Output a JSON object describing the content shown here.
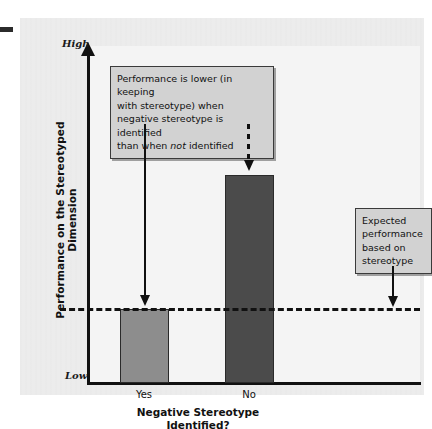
{
  "chart_data": {
    "type": "bar",
    "title": "",
    "xlabel": "Negative Stereotype Identified?",
    "ylabel": "Performance on the Stereotyped Dimension",
    "categories": [
      "Yes",
      "No"
    ],
    "values": [
      1,
      2.82
    ],
    "ylim": [
      0,
      4.55
    ],
    "y_axis_low_label": "Low",
    "y_axis_high_label": "High",
    "grid": false,
    "legend": "none",
    "series": [
      {
        "name": "Performance on the stereotyped dimension",
        "values": [
          1,
          2.82
        ],
        "colors": [
          "#8d8d8d",
          "#4b4b4b"
        ]
      }
    ],
    "reference_lines": [
      {
        "name": "expected-performance-line",
        "value": 1,
        "style": "dashed",
        "label": "Expected performance based on stereotype"
      }
    ],
    "annotations": [
      {
        "name": "stereotype-threat-note",
        "lines": [
          "Performance is lower (in keeping",
          "with stereotype) when",
          "negative stereotype is identified",
          "than when not identified"
        ],
        "text": "Performance is lower (in keeping with stereotype) when negative stereotype is identified than when not identified",
        "italic_word": "not",
        "points_to": [
          "Yes",
          "No"
        ]
      },
      {
        "name": "expected-performance-note",
        "lines": [
          "Expected",
          "performance",
          "based on",
          "stereotype"
        ],
        "text": "Expected performance based on stereotype",
        "points_to": "expected-performance-line"
      }
    ]
  },
  "axes": {
    "y_high": "High",
    "y_low": "Low",
    "y_title": "Performance on the Stereotyped Dimension",
    "x_title_line1": "Negative Stereotype",
    "x_title_line2": "Identified?",
    "x_ticks": [
      "Yes",
      "No"
    ]
  },
  "notes": {
    "left": {
      "line1": "Performance is lower (in keeping",
      "line2": "with stereotype) when",
      "line3": "negative stereotype is identified",
      "line4_a": "than when ",
      "line4_em": "not",
      "line4_b": " identified"
    },
    "right": {
      "line1": "Expected",
      "line2": "performance",
      "line3": "based on",
      "line4": "stereotype"
    }
  },
  "colors": {
    "panel": "#e6e6e6",
    "plot": "#f4f4f4",
    "bar_yes": "#8d8d8d",
    "bar_no": "#4b4b4b",
    "note_fill": "#d2d2d2",
    "ink": "#111111"
  }
}
